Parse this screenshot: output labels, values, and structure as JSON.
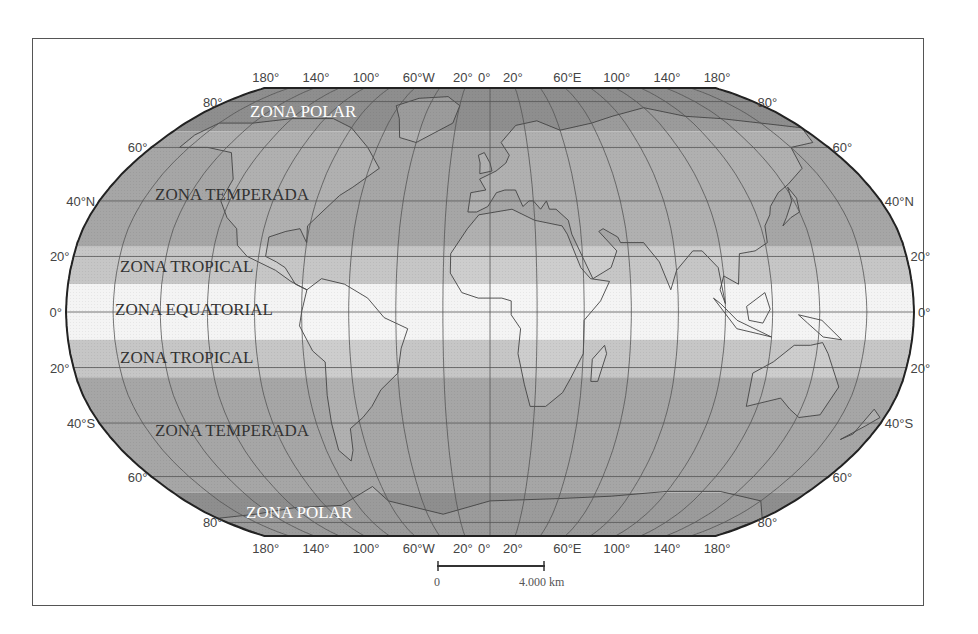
{
  "map": {
    "title": "",
    "projection": "robinson",
    "zones": [
      {
        "id": "polar-north",
        "label": "ZONA POLAR",
        "lat_from": 90,
        "lat_to": 66.5,
        "color": "#8e8e8e",
        "text_style": "light"
      },
      {
        "id": "temperate-north",
        "label": "ZONA TEMPERADA",
        "lat_from": 66.5,
        "lat_to": 23.5,
        "color": "#a6a6a6",
        "text_style": "dark"
      },
      {
        "id": "tropical-north",
        "label": "ZONA TROPICAL",
        "lat_from": 23.5,
        "lat_to": 10,
        "color": "#c6c6c6",
        "text_style": "dark"
      },
      {
        "id": "equatorial",
        "label": "ZONA EQUATORIAL",
        "lat_from": 10,
        "lat_to": -10,
        "color": "#f4f4f4",
        "text_style": "dark"
      },
      {
        "id": "tropical-south",
        "label": "ZONA TROPICAL",
        "lat_from": -10,
        "lat_to": -23.5,
        "color": "#c6c6c6",
        "text_style": "dark"
      },
      {
        "id": "temperate-south",
        "label": "ZONA TEMPERADA",
        "lat_from": -23.5,
        "lat_to": -66.5,
        "color": "#a6a6a6",
        "text_style": "dark"
      },
      {
        "id": "polar-south",
        "label": "ZONA POLAR",
        "lat_from": -66.5,
        "lat_to": -90,
        "color": "#8e8e8e",
        "text_style": "light"
      }
    ],
    "longitude_labels_top": [
      "180°",
      "140°",
      "100°",
      "60°W",
      "20°",
      "0°",
      "20°",
      "60°E",
      "100°",
      "140°",
      "180°"
    ],
    "longitude_labels_bottom": [
      "180°",
      "140°",
      "100°",
      "60°W",
      "20°",
      "0°",
      "20°",
      "60°E",
      "100°",
      "140°",
      "180°"
    ],
    "latitude_labels_left": [
      "80°",
      "60°",
      "40°N",
      "20°",
      "0°",
      "20°",
      "40°S",
      "60°",
      "80°"
    ],
    "latitude_labels_right": [
      "80°",
      "60°",
      "40°N",
      "20°",
      "0°",
      "20°",
      "40°S",
      "60°",
      "80°"
    ],
    "scale_bar": {
      "start_label": "0",
      "end_label": "4.000 km"
    },
    "colors": {
      "outline": "#222222",
      "graticule": "#555555",
      "frame": "#555555"
    }
  }
}
